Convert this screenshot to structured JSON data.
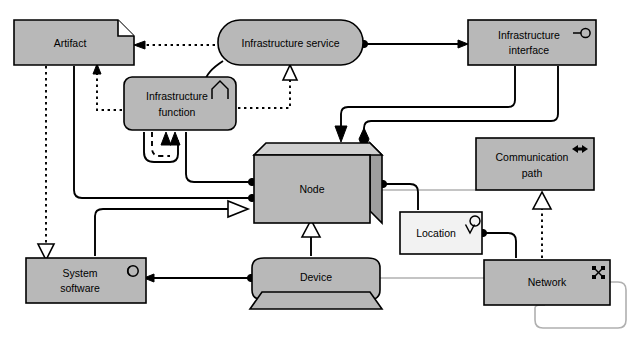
{
  "diagram": {
    "type": "uml-metamodel",
    "canvas": {
      "width": 634,
      "height": 338,
      "background": "#ffffff"
    },
    "colors": {
      "element_fill": "#b8b8b8",
      "element_fill_light": "#f2f2f2",
      "box_top_face": "#cfcfcf",
      "box_side_face": "#9d9d9d",
      "stroke": "#000000",
      "gray_edge": "#b0b0b0"
    }
  },
  "nodes": [
    {
      "id": "artifact",
      "label": "Artifact",
      "shape": "document-folded-corner",
      "icon": "folded-corner-icon",
      "fill": "#b8b8b8",
      "x": 14,
      "y": 20,
      "w": 120,
      "h": 45
    },
    {
      "id": "infrastructure-service",
      "label": "Infrastructure service",
      "shape": "rounded-pill",
      "icon": "none",
      "fill": "#b8b8b8",
      "x": 218,
      "y": 20,
      "w": 145,
      "h": 45
    },
    {
      "id": "infrastructure-interface",
      "label_line1": "Infrastructure",
      "label_line2": "interface",
      "label": "Infrastructure interface",
      "shape": "rectangle",
      "icon": "lollipop-interface-icon",
      "fill": "#b8b8b8",
      "x": 468,
      "y": 20,
      "w": 128,
      "h": 45
    },
    {
      "id": "infrastructure-function",
      "label_line1": "Infrastructure",
      "label_line2": "function",
      "label": "Infrastructure function",
      "shape": "rounded-rectangle",
      "icon": "function-chevron-icon",
      "fill": "#b8b8b8",
      "x": 124,
      "y": 77,
      "w": 112,
      "h": 53
    },
    {
      "id": "node",
      "label": "Node",
      "shape": "3d-box",
      "icon": "none",
      "fill": "#b8b8b8",
      "x": 254,
      "y": 143,
      "w": 128,
      "h": 80
    },
    {
      "id": "communication-path",
      "label_line1": "Communication",
      "label_line2": "path",
      "label": "Communication path",
      "shape": "rectangle",
      "icon": "bidirectional-arrow-icon",
      "fill": "#b8b8b8",
      "x": 476,
      "y": 138,
      "w": 118,
      "h": 52
    },
    {
      "id": "location",
      "label": "Location",
      "shape": "rectangle",
      "icon": "location-pin-icon",
      "fill": "#f2f2f2",
      "x": 400,
      "y": 212,
      "w": 82,
      "h": 42
    },
    {
      "id": "system-software",
      "label_line1": "System",
      "label_line2": "software",
      "label": "System software",
      "shape": "rectangle",
      "icon": "component-circle-icon",
      "fill": "#b8b8b8",
      "x": 26,
      "y": 258,
      "w": 120,
      "h": 45
    },
    {
      "id": "device",
      "label": "Device",
      "shape": "device-with-stand",
      "icon": "none",
      "fill": "#b8b8b8",
      "x": 252,
      "y": 258,
      "w": 128,
      "h": 42
    },
    {
      "id": "network",
      "label": "Network",
      "shape": "rectangle",
      "icon": "network-icon",
      "fill": "#b8b8b8",
      "x": 484,
      "y": 260,
      "w": 126,
      "h": 45
    }
  ],
  "relationships": [
    {
      "id": "svc-to-artifact",
      "from": "infrastructure-service",
      "to": "artifact",
      "style": "dotted",
      "arrow": "open-arrow",
      "meaning": "realization-flow"
    },
    {
      "id": "svc-to-node",
      "from": "infrastructure-service",
      "to": "infrastructure-function",
      "style": "solid",
      "arrow": "filled-arrow",
      "meaning": "assignment"
    },
    {
      "id": "func-to-svc",
      "from": "infrastructure-function",
      "to": "infrastructure-service",
      "style": "dotted",
      "arrow": "hollow-triangle",
      "meaning": "realization"
    },
    {
      "id": "func-to-artifact",
      "from": "infrastructure-function",
      "to": "artifact",
      "style": "dotted",
      "arrow": "open-arrow",
      "meaning": "access"
    },
    {
      "id": "svc-to-interface",
      "from": "infrastructure-service",
      "to": "infrastructure-interface",
      "style": "solid",
      "arrow": "ball-end",
      "meaning": "association"
    },
    {
      "id": "interface-to-node-arrow",
      "from": "infrastructure-interface",
      "to": "node",
      "style": "solid",
      "arrow": "filled-arrow",
      "meaning": "assignment"
    },
    {
      "id": "interface-to-node-diamond",
      "from": "infrastructure-interface",
      "to": "node",
      "style": "solid",
      "arrow": "filled-diamond",
      "meaning": "composition"
    },
    {
      "id": "func-self-loop-dashed",
      "from": "infrastructure-function",
      "to": "infrastructure-function",
      "style": "dashed",
      "arrow": "filled-arrow",
      "meaning": "self-trigger"
    },
    {
      "id": "func-to-node-1",
      "from": "infrastructure-function",
      "to": "node",
      "style": "solid",
      "arrow": "ball-end",
      "meaning": "association"
    },
    {
      "id": "artifact-to-node",
      "from": "artifact",
      "to": "node",
      "style": "solid",
      "arrow": "ball-end",
      "meaning": "association"
    },
    {
      "id": "artifact-to-system-software",
      "from": "artifact",
      "to": "system-software",
      "style": "dotted",
      "arrow": "hollow-triangle",
      "meaning": "realization"
    },
    {
      "id": "system-software-to-node",
      "from": "system-software",
      "to": "node",
      "style": "solid",
      "arrow": "hollow-arrow",
      "meaning": "specialization"
    },
    {
      "id": "device-to-node",
      "from": "device",
      "to": "node",
      "style": "solid",
      "arrow": "hollow-triangle",
      "meaning": "specialization"
    },
    {
      "id": "device-to-system-software",
      "from": "device",
      "to": "system-software",
      "style": "solid",
      "arrow": "ball-end",
      "meaning": "association"
    },
    {
      "id": "node-to-comm-path",
      "from": "node",
      "to": "communication-path",
      "style": "gray",
      "arrow": "none",
      "meaning": "association"
    },
    {
      "id": "node-to-location",
      "from": "node",
      "to": "location",
      "style": "solid",
      "arrow": "ball-end",
      "meaning": "association"
    },
    {
      "id": "location-to-network",
      "from": "location",
      "to": "network",
      "style": "solid",
      "arrow": "ball-end",
      "meaning": "association"
    },
    {
      "id": "network-to-comm-path",
      "from": "network",
      "to": "communication-path",
      "style": "dotted",
      "arrow": "hollow-triangle",
      "meaning": "specialization"
    },
    {
      "id": "device-to-network",
      "from": "device",
      "to": "network",
      "style": "gray",
      "arrow": "none",
      "meaning": "association"
    },
    {
      "id": "network-self-loop",
      "from": "network",
      "to": "network",
      "style": "gray",
      "arrow": "none",
      "meaning": "self-association"
    }
  ]
}
